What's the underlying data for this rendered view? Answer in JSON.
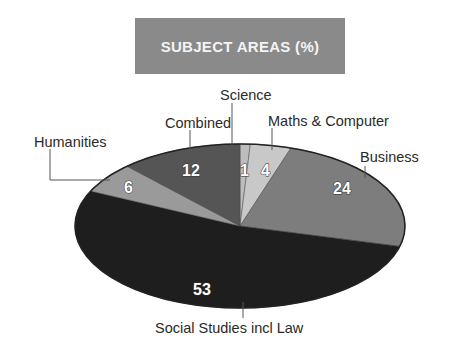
{
  "title": "SUBJECT AREAS (%)",
  "chart_data": {
    "type": "pie",
    "title": "SUBJECT AREAS (%)",
    "categories": [
      "Science",
      "Maths & Computer",
      "Business",
      "Social Studies incl Law",
      "Humanities",
      "Combined"
    ],
    "values": [
      1,
      4,
      24,
      53,
      6,
      12
    ],
    "colors": [
      "#bdbdbd",
      "#c8c8c8",
      "#7d7d7d",
      "#1e1e1e",
      "#9a9a9a",
      "#555555"
    ],
    "unit": "%",
    "style": "3D-tilted ellipse pie, clockwise from top"
  },
  "labels": {
    "science": "Science",
    "maths": "Maths & Computer",
    "business": "Business",
    "social": "Social Studies incl Law",
    "humanities": "Humanities",
    "combined": "Combined"
  },
  "values": {
    "science": "1",
    "maths": "4",
    "business": "24",
    "social": "53",
    "humanities": "6",
    "combined": "12"
  }
}
